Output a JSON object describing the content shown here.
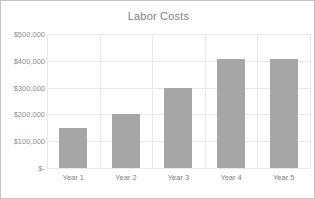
{
  "chart_data": {
    "type": "bar",
    "title": "Labor Costs",
    "xlabel": "",
    "ylabel": "",
    "categories": [
      "Year 1",
      "Year 2",
      "Year 3",
      "Year 4",
      "Year 5"
    ],
    "values": [
      150000,
      200000,
      300000,
      405000,
      405000
    ],
    "ylim": [
      0,
      500000
    ],
    "ytick_values": [
      0,
      100000,
      200000,
      300000,
      400000,
      500000
    ],
    "ytick_labels": [
      "$-",
      "$100,000",
      "$200,000",
      "$300,000",
      "$400,000",
      "$500,000"
    ],
    "grid": {
      "horizontal": true,
      "vertical": true
    },
    "legend": {
      "visible": false,
      "position": "none"
    },
    "series": [
      {
        "name": "Labor Costs",
        "color": "#a6a6a6",
        "values": [
          150000,
          200000,
          300000,
          405000,
          405000
        ]
      }
    ]
  },
  "colors": {
    "bar": "#a6a6a6",
    "gridline": "#e8e8e8",
    "axis": "#d9d9d9",
    "title_text": "#7f7f7f",
    "tick_text": "#8c8c8c",
    "border": "#c4c4c4",
    "background": "#ffffff"
  }
}
